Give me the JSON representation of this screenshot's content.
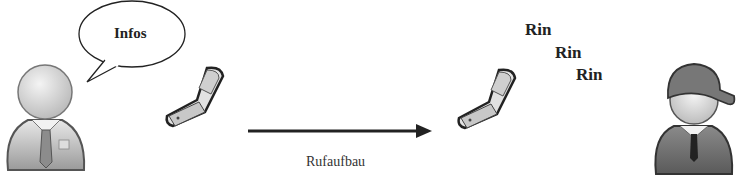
{
  "caller": {
    "name": "caller-person",
    "speech_bubble": "Infos"
  },
  "callee": {
    "name": "callee-person-with-cap"
  },
  "arrow": {
    "label": "Rufaufbau",
    "direction": "right"
  },
  "ring": [
    "Rin",
    "Rin",
    "Rin"
  ],
  "colors": {
    "line": "#222222",
    "fill_light": "#e6e6e6",
    "fill_mid": "#bdbdbd",
    "fill_dark": "#7a7a7a"
  }
}
